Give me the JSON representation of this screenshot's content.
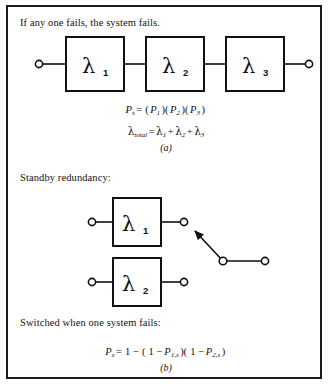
{
  "figure": {
    "border_color": "#1a1a1a",
    "background": "#ffffff"
  },
  "series_section": {
    "caption": "If any one fails, the system fails.",
    "blocks": [
      {
        "symbol": "λ",
        "subscript": "1"
      },
      {
        "symbol": "λ",
        "subscript": "2"
      },
      {
        "symbol": "λ",
        "subscript": "3"
      }
    ],
    "formulas": {
      "success_probability": "P_s = (P_1)(P_2)(P_3)",
      "total_failure_rate": "λ_total = λ_1 + λ_2 + λ_3"
    },
    "subfigure_label": "(a)"
  },
  "standby_section": {
    "caption": "Standby redundancy:",
    "blocks": [
      {
        "symbol": "λ",
        "subscript": "1"
      },
      {
        "symbol": "λ",
        "subscript": "2"
      }
    ],
    "switch": {
      "name": "changeover-switch",
      "state": "connected-to-upper-branch"
    },
    "switch_caption": "Switched when one system fails:",
    "formula": "P_s = 1 − (1 − P_1,s)(1 − P_2,s)",
    "subfigure_label": "(b)"
  },
  "symbols": {
    "lambda": "λ",
    "P": "P",
    "equals": "=",
    "plus": "+",
    "minus": "−",
    "one": "1",
    "sub_s": "s",
    "sub_total": "total",
    "sub_1": "1",
    "sub_2": "2",
    "sub_3": "3",
    "sub_1s": "1,s",
    "sub_2s": "2,s",
    "paren_open": "(",
    "paren_close": ")"
  }
}
